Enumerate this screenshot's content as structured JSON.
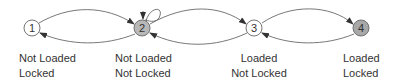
{
  "diagram": {
    "type": "state-transition",
    "nodes": [
      {
        "id": "1",
        "label": "1",
        "fill": "#ffffff",
        "line1": "Not Loaded",
        "line2": "Locked"
      },
      {
        "id": "2",
        "label": "2",
        "fill": "#b8b8b8",
        "line1": "Not Loaded",
        "line2": "Not Locked"
      },
      {
        "id": "3",
        "label": "3",
        "fill": "#ffffff",
        "line1": "Loaded",
        "line2": "Not Locked"
      },
      {
        "id": "4",
        "label": "4",
        "fill": "#a8a8a8",
        "line1": "Loaded",
        "line2": "Locked"
      }
    ],
    "edges": [
      {
        "from": "1",
        "to": "2"
      },
      {
        "from": "2",
        "to": "1"
      },
      {
        "from": "2",
        "to": "2"
      },
      {
        "from": "2",
        "to": "3"
      },
      {
        "from": "3",
        "to": "2"
      },
      {
        "from": "3",
        "to": "4"
      },
      {
        "from": "4",
        "to": "3"
      }
    ]
  }
}
